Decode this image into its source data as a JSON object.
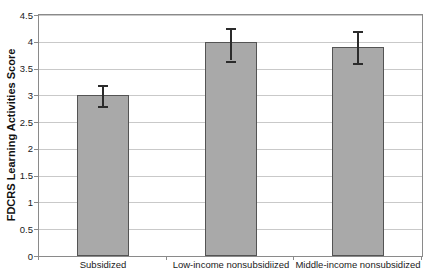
{
  "chart_data": {
    "type": "bar",
    "title": "",
    "xlabel": "",
    "ylabel": "FDCRS Learning Activities Score",
    "categories": [
      "Subsidized",
      "Low-income nonsubsidiized",
      "Middle-income nonsubsidized"
    ],
    "values": [
      3.0,
      4.0,
      3.9
    ],
    "error_low": [
      2.8,
      3.65,
      3.6
    ],
    "error_high": [
      3.2,
      4.25,
      4.2
    ],
    "ylim": [
      0,
      4.5
    ],
    "ytick_step": 0.5,
    "ytick_labels": [
      "0",
      "0.5",
      "1",
      "1.5",
      "2",
      "2.5",
      "3",
      "3.5",
      "4",
      "4.5"
    ],
    "grid": true,
    "legend": false,
    "colors": {
      "bar_fill": "#a9a9a9",
      "bar_border": "#545454",
      "error_bar": "#2b2b2b",
      "gridline": "#c9c9c9",
      "plot_border": "#8a8a8a",
      "text": "#1a1a1a",
      "background": "#ffffff"
    }
  }
}
